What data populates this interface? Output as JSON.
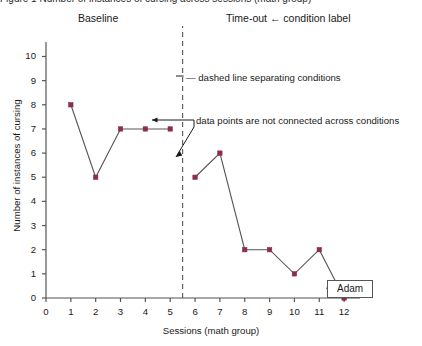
{
  "figure": {
    "clipped_header": "Figure 1  Number of instances of cursing across sessions (math group)",
    "condition_labels": {
      "baseline": "Baseline",
      "treatment": "Time-out ← condition label"
    },
    "annotations": [
      "— dashed line separating conditions",
      "data points are not connected across conditions"
    ],
    "subject_label": "Adam"
  },
  "colors": {
    "marker": "#8c2d4a",
    "line": "#555555",
    "axis": "#555555",
    "dashed": "#555555",
    "text": "#1a1a1a"
  },
  "chart_data": {
    "type": "line",
    "title": "",
    "xlabel": "Sessions (math group)",
    "ylabel": "Number of instances of cursing",
    "xlim": [
      0,
      12.6
    ],
    "ylim": [
      0,
      10.6
    ],
    "xticks": [
      0,
      1,
      2,
      3,
      4,
      5,
      6,
      7,
      8,
      9,
      10,
      11,
      12
    ],
    "yticks": [
      0,
      1,
      2,
      3,
      4,
      5,
      6,
      7,
      8,
      9,
      10
    ],
    "xtick_labels": [
      "0",
      "1",
      "2",
      "3",
      "4",
      "5",
      "6",
      "7",
      "8",
      "9",
      "10",
      "11",
      "12"
    ],
    "ytick_labels": [
      "0",
      "1",
      "2",
      "3",
      "4",
      "5",
      "6",
      "7",
      "8",
      "9",
      "10"
    ],
    "grid": false,
    "legend": "none",
    "phase_change_line": {
      "x": 5.5,
      "style": "dashed"
    },
    "series": [
      {
        "name": "Baseline",
        "x": [
          1,
          2,
          3,
          4,
          5
        ],
        "values": [
          8,
          5,
          7,
          7,
          7
        ]
      },
      {
        "name": "Time-out",
        "x": [
          6,
          7,
          8,
          9,
          10,
          11,
          12
        ],
        "values": [
          5,
          6,
          2,
          2,
          1,
          2,
          0
        ]
      }
    ]
  }
}
